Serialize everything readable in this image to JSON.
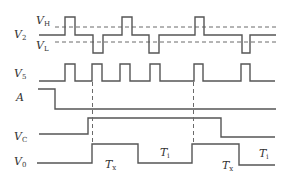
{
  "diagram": {
    "type": "timing-diagram",
    "signals": [
      {
        "id": "V2",
        "label": "V",
        "sub": "2"
      },
      {
        "id": "V5",
        "label": "V",
        "sub": "5"
      },
      {
        "id": "A",
        "label": "A",
        "sub": ""
      },
      {
        "id": "VC",
        "label": "V",
        "sub": "C"
      },
      {
        "id": "V0",
        "label": "V",
        "sub": "0"
      }
    ],
    "thresholds": [
      {
        "id": "VH",
        "label": "V",
        "sub": "H"
      },
      {
        "id": "VL",
        "label": "V",
        "sub": "L"
      }
    ],
    "intervals": [
      {
        "label": "T",
        "sub": "x"
      },
      {
        "label": "T",
        "sub": "i"
      },
      {
        "label": "T",
        "sub": "x"
      },
      {
        "label": "T",
        "sub": "i"
      }
    ],
    "colors": {
      "line": "#555555",
      "dash": "#6a6a6a",
      "text": "#333333",
      "background": "#ffffff"
    }
  }
}
